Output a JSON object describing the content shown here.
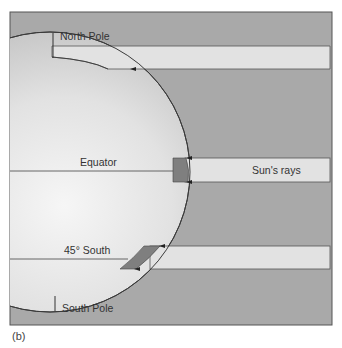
{
  "figure": {
    "caption": "(b)",
    "labels": {
      "north_pole": "North Pole",
      "equator": "Equator",
      "sun_rays": "Sun's rays",
      "south_45": "45° South",
      "south_pole": "South Pole"
    },
    "colors": {
      "background": "#a9a9a9",
      "beam": "#e2e2e2",
      "globe_light": "#f2f2f2",
      "globe_dark": "#c4c4c4",
      "patch": "#7f7f7f",
      "line": "#3a3a3a"
    },
    "beams": [
      {
        "name": "north-pole-beam",
        "top": 46,
        "bottom": 69
      },
      {
        "name": "equator-beam",
        "top": 158,
        "bottom": 182
      },
      {
        "name": "south-45-beam",
        "top": 246,
        "bottom": 269
      }
    ]
  }
}
